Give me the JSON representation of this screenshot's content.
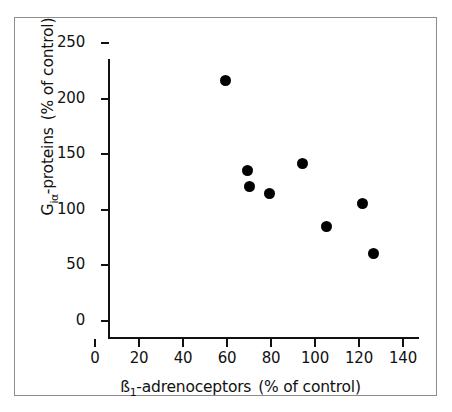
{
  "chart_data": {
    "type": "scatter",
    "title": "",
    "xlabel": "ß₁-adrenoceptors  (% of control)",
    "ylabel": "Gᵢₐ-proteins  (% of control)",
    "xlabel_parts": {
      "base": "ß",
      "sub": "1",
      "rest": "-adrenoceptors",
      "units": "(% of control)"
    },
    "ylabel_parts": {
      "base": "G",
      "sub": "iα",
      "rest": "-proteins",
      "units": "(% of control)"
    },
    "xlim": [
      0,
      140
    ],
    "ylim": [
      0,
      250
    ],
    "xticks": [
      0,
      20,
      40,
      60,
      80,
      100,
      120,
      140
    ],
    "yticks": [
      0,
      50,
      100,
      150,
      200,
      250
    ],
    "xtick_labels": [
      "0",
      "20",
      "40",
      "60",
      "80",
      "100",
      "120",
      "140"
    ],
    "ytick_labels": [
      "0",
      "50",
      "100",
      "150",
      "200",
      "250"
    ],
    "grid": false,
    "legend": "none",
    "marker": "filled-circle",
    "marker_color": "#000000",
    "points": [
      {
        "x": 53,
        "y": 232
      },
      {
        "x": 63,
        "y": 151
      },
      {
        "x": 64,
        "y": 136
      },
      {
        "x": 73,
        "y": 130
      },
      {
        "x": 88,
        "y": 157
      },
      {
        "x": 99,
        "y": 100
      },
      {
        "x": 115,
        "y": 121
      },
      {
        "x": 120,
        "y": 76
      }
    ]
  },
  "figure": {
    "border_color": "#8d8d8d",
    "background": "#ffffff",
    "axis_color": "#111111"
  }
}
